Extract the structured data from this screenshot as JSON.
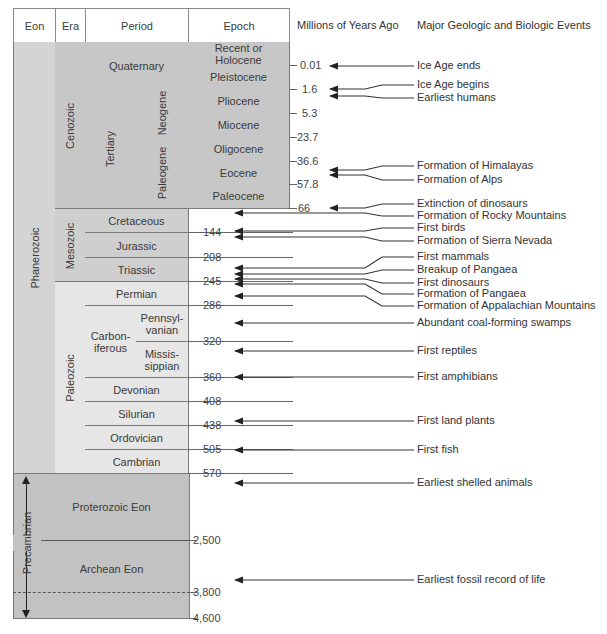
{
  "headers": {
    "eon": "Eon",
    "era": "Era",
    "period": "Period",
    "epoch": "Epoch",
    "mya": "Millions of Years Ago",
    "events": "Major Geologic and Biologic Events"
  },
  "eons": {
    "phanerozoic": "Phanerozoic",
    "precambrian": "Precambrian",
    "proterozoic": "Proterozoic Eon",
    "archean": "Archean Eon"
  },
  "eras": {
    "cenozoic": "Cenozoic",
    "mesozoic": "Mesozoic",
    "paleozoic": "Paleozoic"
  },
  "periods": {
    "quaternary": "Quaternary",
    "tertiary": "Tertiary",
    "neogene": "Neogene",
    "paleogene": "Paleogene",
    "cretaceous": "Cretaceous",
    "jurassic": "Jurassic",
    "triassic": "Triassic",
    "permian": "Permian",
    "carboniferous": "Carbon-\niferous",
    "pennsylvanian": "Pennsyl-\nvanian",
    "mississippian": "Missis-\nsippian",
    "devonian": "Devonian",
    "silurian": "Silurian",
    "ordovician": "Ordovician",
    "cambrian": "Cambrian"
  },
  "epochs": [
    "Recent or\nHolocene",
    "Pleistocene",
    "Pliocene",
    "Miocene",
    "Oligocene",
    "Eocene",
    "Paleocene"
  ],
  "ages": [
    "0.01",
    "1.6",
    "5.3",
    "23.7",
    "36.6",
    "57.8",
    "66",
    "144",
    "208",
    "245",
    "286",
    "320",
    "360",
    "408",
    "438",
    "505",
    "570",
    "2,500",
    "3,800",
    "4,600"
  ],
  "events": [
    "Ice Age ends",
    "Ice Age begins",
    "Earliest humans",
    "Formation of Himalayas",
    "Formation of Alps",
    "Extinction of dinosaurs",
    "Formation of Rocky Mountains",
    "First birds",
    "Formation of Sierra Nevada",
    "First mammals",
    "Breakup of Pangaea",
    "First dinosaurs",
    "Formation of Pangaea",
    "Formation of Appalachian Mountains",
    "Abundant coal-forming swamps",
    "First reptiles",
    "First amphibians",
    "First land plants",
    "First fish",
    "Earliest shelled animals",
    "Earliest fossil record of life"
  ]
}
